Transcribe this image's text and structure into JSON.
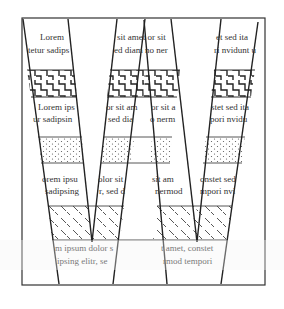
{
  "diagram": {
    "title": "",
    "colors": {
      "stroke": "#222222",
      "text": "#333333",
      "background": "#ffffff"
    },
    "patterns": [
      "zigzag-pattern",
      "dotted-pattern",
      "diagonal-dash-pattern"
    ],
    "text_bands": {
      "band1": {
        "s1": [
          "Lorem",
          "tetur sadips"
        ],
        "s2": [
          "sit amet or sit",
          "ed diam no ner"
        ],
        "s3": [
          "",
          ""
        ],
        "s4": [
          "et sed ita",
          "ri nvidunt u"
        ]
      },
      "band2": {
        "s1": [
          "Lorem ips",
          "ur sadipsin"
        ],
        "s2": [
          "or sit am",
          "sed dia"
        ],
        "s3": [
          "or sit a",
          "o nerm"
        ],
        "s4": [
          "stet sed ita",
          "pori nvidu"
        ]
      },
      "band3": {
        "s1": [
          "orem ipsu",
          "sadipsing"
        ],
        "s2": [
          "olor sit",
          "r, sed d"
        ],
        "s3": [
          "sit am",
          "nermod"
        ],
        "s4": [
          "onstet sed",
          "mpori nvi"
        ]
      },
      "band4": {
        "left": [
          "m ipsum dolor s",
          "ipsing elitr, se"
        ],
        "right": [
          "t amet, constet",
          "rmod tempori"
        ]
      }
    }
  }
}
